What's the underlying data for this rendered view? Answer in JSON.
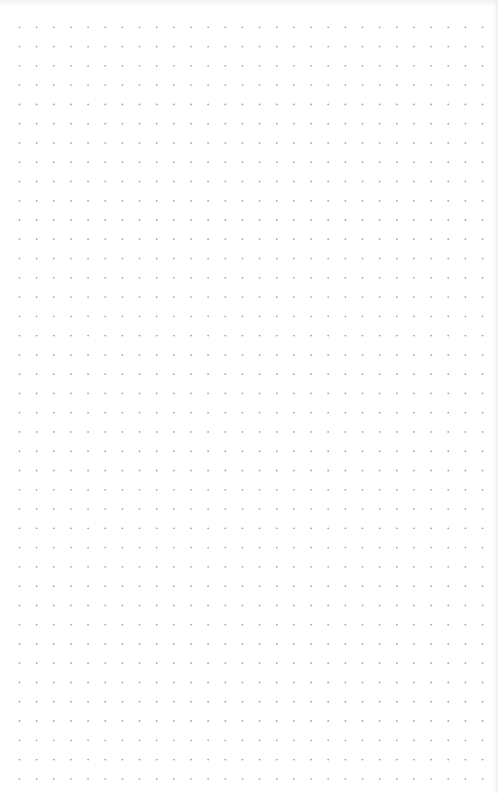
{
  "canvas": {
    "type": "dot-grid",
    "background_color": "#ffffff",
    "dot_color": "#a6a6a6",
    "dot_radius": 0.9,
    "origin_x": 19.5,
    "origin_y": 27.3,
    "spacing_x": 17.15,
    "spacing_y": 19.27,
    "columns": 28,
    "rows": 40
  }
}
